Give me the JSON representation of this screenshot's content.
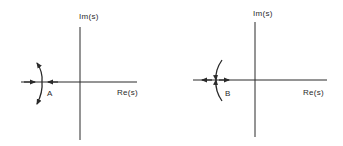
{
  "diagrams": [
    {
      "id": "A",
      "label": "A",
      "imag_axis_label": "Im(s)",
      "real_axis_label": "Re(s)",
      "real_axis_arrows": "converging",
      "arc_arrows": "outward"
    },
    {
      "id": "B",
      "label": "B",
      "imag_axis_label": "Im(s)",
      "real_axis_label": "Re(s)",
      "real_axis_arrows": "diverging",
      "arc_arrows": "inward"
    }
  ],
  "colors": {
    "line": "#2a2a2a",
    "background": "#ffffff"
  }
}
